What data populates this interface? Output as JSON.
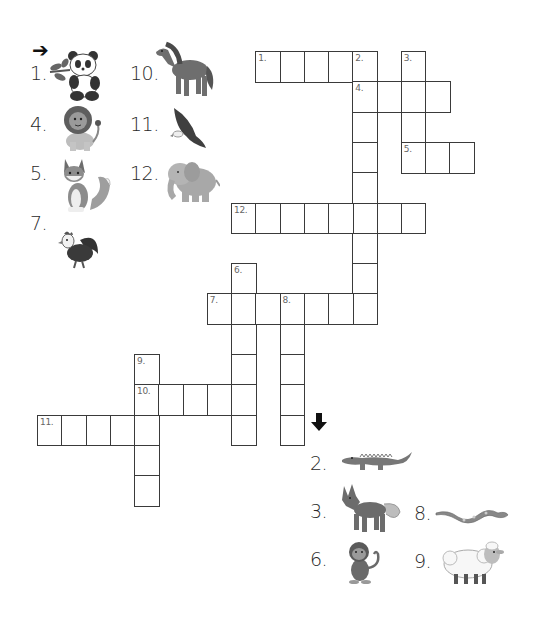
{
  "puzzle": {
    "title": "Animal Crossword",
    "cell_grid": {
      "origin_x": 37,
      "origin_y": 51,
      "cell_w": 24.25,
      "cell_h": 30.3
    },
    "across_arrow": "➔",
    "down_arrow": "🡇",
    "entries": [
      {
        "number": "1.",
        "direction": "across",
        "row": 0,
        "col": 9,
        "length": 5,
        "animal": "panda"
      },
      {
        "number": "2.",
        "direction": "down",
        "row": 0,
        "col": 13,
        "length": 9,
        "animal": "crocodile"
      },
      {
        "number": "3.",
        "direction": "down",
        "row": 0,
        "col": 15,
        "length": 4,
        "animal": "wolf"
      },
      {
        "number": "4.",
        "direction": "across",
        "row": 1,
        "col": 13,
        "length": 4,
        "animal": "lion"
      },
      {
        "number": "5.",
        "direction": "across",
        "row": 3,
        "col": 15,
        "length": 3,
        "animal": "fox"
      },
      {
        "number": "12.",
        "direction": "across",
        "row": 5,
        "col": 8,
        "length": 8,
        "animal": "elephant"
      },
      {
        "number": "6.",
        "direction": "down",
        "row": 7,
        "col": 8,
        "length": 6,
        "animal": "monkey"
      },
      {
        "number": "7.",
        "direction": "across",
        "row": 8,
        "col": 7,
        "length": 7,
        "animal": "rooster"
      },
      {
        "number": "8.",
        "direction": "down",
        "row": 8,
        "col": 10,
        "length": 5,
        "animal": "snake"
      },
      {
        "number": "9.",
        "direction": "down",
        "row": 10,
        "col": 4,
        "length": 5,
        "animal": "sheep"
      },
      {
        "number": "10.",
        "direction": "across",
        "row": 11,
        "col": 4,
        "length": 5,
        "animal": "horse"
      },
      {
        "number": "11.",
        "direction": "across",
        "row": 12,
        "col": 0,
        "length": 5,
        "animal": "eagle"
      }
    ],
    "across_clues": [
      {
        "label": "1.",
        "icon": "panda-icon",
        "x": 30,
        "y": 62
      },
      {
        "label": "4.",
        "icon": "lion-icon",
        "x": 30,
        "y": 113
      },
      {
        "label": "5.",
        "icon": "fox-icon",
        "x": 30,
        "y": 162
      },
      {
        "label": "7.",
        "icon": "rooster-icon",
        "x": 30,
        "y": 212
      },
      {
        "label": "10.",
        "icon": "horse-icon",
        "x": 130,
        "y": 62
      },
      {
        "label": "11.",
        "icon": "eagle-icon",
        "x": 130,
        "y": 113
      },
      {
        "label": "12.",
        "icon": "elephant-icon",
        "x": 130,
        "y": 162
      }
    ],
    "down_clues": [
      {
        "label": "2.",
        "icon": "crocodile-icon",
        "x": 310,
        "y": 452
      },
      {
        "label": "3.",
        "icon": "wolf-icon",
        "x": 310,
        "y": 500
      },
      {
        "label": "6.",
        "icon": "monkey-icon",
        "x": 310,
        "y": 548
      },
      {
        "label": "8.",
        "icon": "snake-icon",
        "x": 414,
        "y": 502
      },
      {
        "label": "9.",
        "icon": "sheep-icon",
        "x": 414,
        "y": 550
      }
    ],
    "colors": {
      "grid_line": "#3a3a3a",
      "number_text": "#666666",
      "clue_text": "#2a2a2a",
      "illustration": "#6b6b6b"
    }
  }
}
